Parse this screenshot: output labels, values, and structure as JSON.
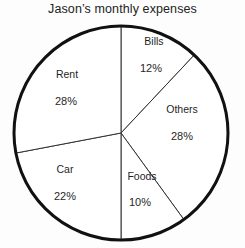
{
  "chart_data": {
    "type": "pie",
    "title": "Jason’s monthly expenses",
    "xlabel": "",
    "ylabel": "",
    "legend": "none",
    "grid": false,
    "start_angle_deg": 90,
    "direction": "clockwise",
    "units": "percent",
    "total": 100,
    "categories": [
      "Bills",
      "Others",
      "Foods",
      "Car",
      "Rent"
    ],
    "values": [
      12,
      28,
      10,
      22,
      28
    ],
    "labels": [
      "12%",
      "28%",
      "10%",
      "22%",
      "28%"
    ],
    "slices": [
      {
        "name": "Bills",
        "value": 12,
        "label": "Bills",
        "value_text": "12%",
        "fill": "#ffffff",
        "stroke": "#111111"
      },
      {
        "name": "Others",
        "value": 28,
        "label": "Others",
        "value_text": "28%",
        "fill": "#ffffff",
        "stroke": "#111111"
      },
      {
        "name": "Foods",
        "value": 10,
        "label": "Foods",
        "value_text": "10%",
        "fill": "#ffffff",
        "stroke": "#111111"
      },
      {
        "name": "Car",
        "value": 22,
        "label": "Car",
        "value_text": "22%",
        "fill": "#ffffff",
        "stroke": "#111111"
      },
      {
        "name": "Rent",
        "value": 28,
        "label": "Rent",
        "value_text": "28%",
        "fill": "#ffffff",
        "stroke": "#111111"
      }
    ]
  },
  "style": {
    "background": "#fdfdfd",
    "outline_color": "#111111",
    "divider_color": "#333333",
    "text_color": "#1f1f1f",
    "outline_width": 3,
    "divider_width": 1
  },
  "geometry": {
    "center_x": 121,
    "center_y": 133,
    "radius": 107
  }
}
